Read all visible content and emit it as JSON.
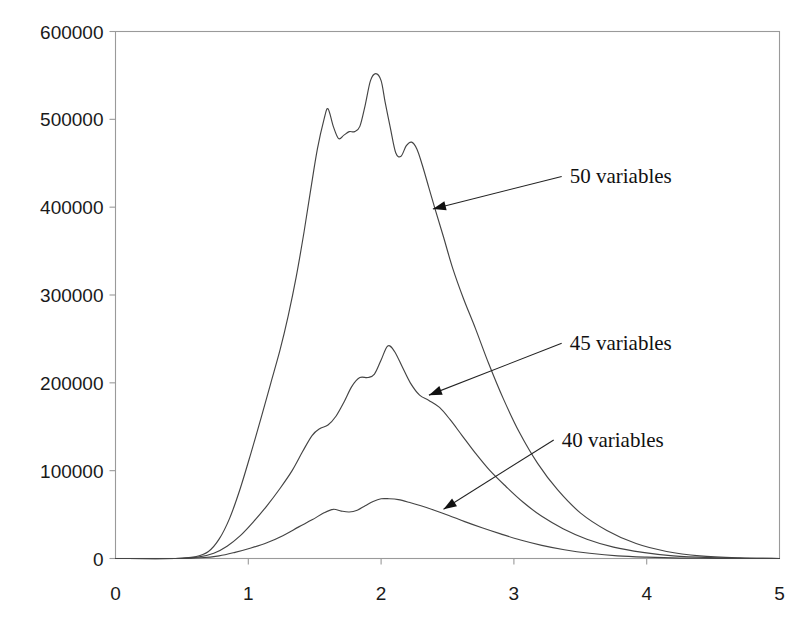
{
  "chart_data": {
    "type": "line",
    "title": "",
    "subtitle": "",
    "xlabel": "",
    "ylabel": "",
    "xlim": [
      0,
      5
    ],
    "ylim": [
      0,
      600000
    ],
    "x_ticks": [
      "0",
      "1",
      "2",
      "3",
      "4",
      "5"
    ],
    "y_ticks": [
      "0",
      "100000",
      "200000",
      "300000",
      "400000",
      "500000",
      "600000"
    ],
    "grid": false,
    "legend_position": "inline-annotations",
    "line_color": "#444444",
    "axis_color": "#9a9a9a",
    "text_color": "#111111",
    "annotations": [
      {
        "label": "50 variables",
        "text_x": 3.39,
        "text_y": 435000,
        "arrow_to_x": 2.39,
        "arrow_to_y": 398000
      },
      {
        "label": "45 variables",
        "text_x": 3.39,
        "text_y": 245000,
        "arrow_to_x": 2.36,
        "arrow_to_y": 186000
      },
      {
        "label": "40 variables",
        "text_x": 3.33,
        "text_y": 135000,
        "arrow_to_x": 2.47,
        "arrow_to_y": 56000
      }
    ],
    "series": [
      {
        "name": "50 variables",
        "x": [
          0.0,
          0.45,
          0.6,
          0.7,
          0.78,
          0.86,
          0.94,
          1.02,
          1.1,
          1.17,
          1.24,
          1.3,
          1.36,
          1.42,
          1.47,
          1.52,
          1.57,
          1.6,
          1.64,
          1.68,
          1.72,
          1.76,
          1.8,
          1.84,
          1.88,
          1.92,
          1.96,
          2.0,
          2.03,
          2.07,
          2.11,
          2.15,
          2.19,
          2.23,
          2.27,
          2.31,
          2.36,
          2.41,
          2.47,
          2.54,
          2.62,
          2.71,
          2.81,
          2.92,
          3.04,
          3.18,
          3.33,
          3.5,
          3.7,
          3.92,
          4.15,
          4.4,
          4.7,
          5.0
        ],
        "y": [
          0,
          0,
          2000,
          8000,
          22000,
          46000,
          80000,
          120000,
          162000,
          200000,
          238000,
          276000,
          320000,
          372000,
          420000,
          466000,
          500000,
          512000,
          492000,
          478000,
          482000,
          486000,
          486000,
          492000,
          516000,
          544000,
          552000,
          544000,
          520000,
          490000,
          462000,
          458000,
          470000,
          474000,
          466000,
          448000,
          422000,
          396000,
          366000,
          330000,
          296000,
          262000,
          222000,
          182000,
          144000,
          108000,
          78000,
          52000,
          32000,
          17000,
          8000,
          3000,
          800,
          0
        ]
      },
      {
        "name": "45 variables",
        "x": [
          0.0,
          0.45,
          0.62,
          0.74,
          0.84,
          0.94,
          1.04,
          1.14,
          1.24,
          1.33,
          1.41,
          1.48,
          1.54,
          1.6,
          1.66,
          1.72,
          1.78,
          1.84,
          1.9,
          1.95,
          2.0,
          2.05,
          2.1,
          2.16,
          2.22,
          2.29,
          2.36,
          2.44,
          2.52,
          2.61,
          2.71,
          2.82,
          2.94,
          3.07,
          3.21,
          3.37,
          3.55,
          3.75,
          3.97,
          4.2,
          4.48,
          4.75,
          5.0
        ],
        "y": [
          0,
          0,
          1500,
          6000,
          14000,
          26000,
          42000,
          60000,
          80000,
          100000,
          122000,
          140000,
          148000,
          152000,
          162000,
          178000,
          196000,
          206000,
          206000,
          210000,
          226000,
          242000,
          236000,
          218000,
          200000,
          186000,
          180000,
          172000,
          158000,
          140000,
          120000,
          100000,
          82000,
          64000,
          48000,
          34000,
          22000,
          13000,
          7000,
          3000,
          1000,
          200,
          0
        ]
      },
      {
        "name": "40 variables",
        "x": [
          0.0,
          0.45,
          0.64,
          0.78,
          0.9,
          1.02,
          1.14,
          1.26,
          1.38,
          1.48,
          1.57,
          1.64,
          1.7,
          1.76,
          1.82,
          1.88,
          1.94,
          2.0,
          2.06,
          2.13,
          2.21,
          2.3,
          2.4,
          2.51,
          2.63,
          2.76,
          2.9,
          3.05,
          3.21,
          3.38,
          3.57,
          3.78,
          4.0,
          4.25,
          4.55,
          4.8,
          5.0
        ],
        "y": [
          0,
          0,
          800,
          3000,
          7000,
          12000,
          18000,
          26000,
          36000,
          44000,
          52000,
          56000,
          54000,
          53000,
          55000,
          60000,
          65000,
          68000,
          68000,
          67000,
          64000,
          60000,
          55000,
          49000,
          42000,
          35000,
          28000,
          21000,
          15000,
          10000,
          6000,
          3000,
          1500,
          500,
          100,
          0,
          0
        ]
      }
    ]
  },
  "top_crop": {
    "text": ""
  }
}
